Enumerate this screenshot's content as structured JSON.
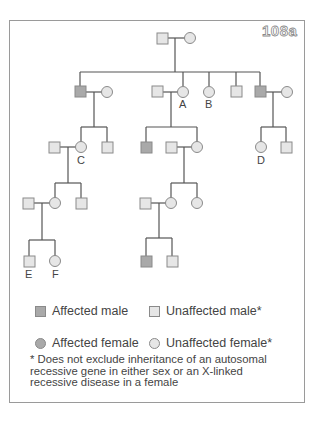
{
  "figure": {
    "id": "108a"
  },
  "colors": {
    "affected_fill": "#a9a9a9",
    "unaffected_fill": "#e6e6e6",
    "stroke": "#8a8a8a",
    "line": "#555555"
  },
  "pedigree": {
    "individual_labels": {
      "A": "A",
      "B": "B",
      "C": "C",
      "D": "D",
      "E": "E",
      "F": "F"
    },
    "generations": [
      {
        "gen": 1,
        "members": [
          "unaffected male",
          "unaffected female"
        ]
      },
      {
        "gen": 2,
        "members": [
          "affected male + unaffected female",
          "unaffected male + unaffected female (A)",
          "unaffected female (B)",
          "unaffected male",
          "affected male + unaffected female"
        ]
      },
      {
        "gen": 3,
        "members": [
          "unaffected male + unaffected female (C)",
          "unaffected male",
          "affected male",
          "unaffected male + unaffected female",
          "unaffected female (D)",
          "unaffected male"
        ]
      },
      {
        "gen": 4,
        "members": [
          "unaffected male + unaffected female",
          "unaffected male",
          "unaffected male + unaffected female",
          "unaffected female"
        ]
      },
      {
        "gen": 5,
        "members": [
          "unaffected male (E)",
          "unaffected female (F)",
          "affected male",
          "unaffected male"
        ]
      }
    ]
  },
  "legend": {
    "affected_male": "Affected male",
    "unaffected_male": "Unaffected male*",
    "affected_female": "Affected female",
    "unaffected_female": "Unaffected female*"
  },
  "footnote": "* Does not exclude inheritance of an autosomal recessive gene in either sex or an X-linked recessive disease in a female"
}
